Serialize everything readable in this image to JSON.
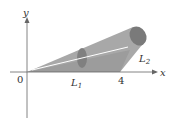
{
  "diagram": {
    "type": "solid-of-revolution",
    "axes": {
      "x_label": "x",
      "y_label": "y",
      "origin_label": "0"
    },
    "labels": {
      "L1": "L",
      "L1_sub": "1",
      "L2": "L",
      "L2_sub": "2",
      "tick_4": "4"
    },
    "colors": {
      "surface": "#9a9a9a",
      "surface_dark": "#6f6f6f",
      "highlight": "#ffffff",
      "axis": "#666666"
    }
  }
}
